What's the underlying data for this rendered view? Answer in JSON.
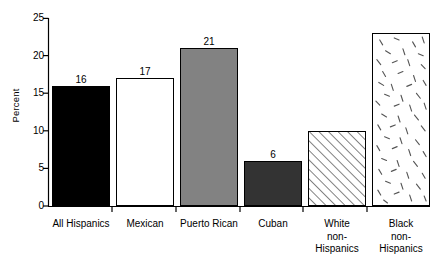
{
  "chart_data": {
    "type": "bar",
    "title": "",
    "xlabel": "",
    "ylabel": "Percent",
    "ylim": [
      0,
      25
    ],
    "yticks": [
      0,
      5,
      10,
      15,
      20,
      25
    ],
    "ytick_labels": [
      "0",
      "5",
      "10",
      "15",
      "20",
      "25"
    ],
    "grid": false,
    "legend": "none",
    "categories": [
      "All Hispanics",
      "Mexican",
      "Puerto Rican",
      "Cuban",
      "White\nnon-\nHispanics",
      "Black\nnon-\nHispanics"
    ],
    "values": [
      16,
      17,
      21,
      6,
      10,
      23
    ],
    "value_labels": [
      "16",
      "17",
      "21",
      "6",
      "10",
      "23"
    ],
    "bar_styles": [
      "solid-black",
      "solid-white",
      "solid-gray",
      "solid-dark-gray",
      "diagonal-hatch",
      "speckled-dashes"
    ],
    "bar_colors": [
      "#000000",
      "#ffffff",
      "#828282",
      "#333333",
      "#ffffff",
      "#ffffff"
    ],
    "axis_color": "#000000"
  }
}
